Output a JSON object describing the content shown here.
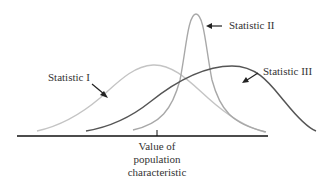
{
  "diagram": {
    "axis": {
      "label_lines": [
        "Value of",
        "population",
        "characteristic"
      ],
      "tick_x": 157
    },
    "curves": [
      {
        "id": "statistic-1",
        "label": "Statistic I",
        "color": "#c4c4c4",
        "description": "unbiased, wide spread"
      },
      {
        "id": "statistic-2",
        "label": "Statistic II",
        "color": "#a8a8a8",
        "description": "biased, narrow spread"
      },
      {
        "id": "statistic-3",
        "label": "Statistic III",
        "color": "#555555",
        "description": "biased, wide spread"
      }
    ],
    "colors": {
      "axis": "#111111",
      "text": "#333333",
      "arrow": "#222222"
    }
  }
}
